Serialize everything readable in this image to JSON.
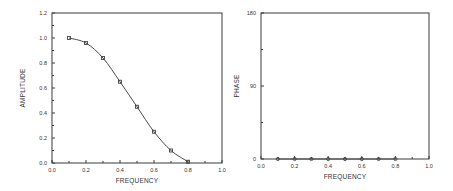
{
  "chart_data": [
    {
      "type": "line",
      "title": "",
      "xlabel": "FREQUENCY",
      "ylabel": "AMPLITUDE",
      "xlim": [
        0.0,
        1.0
      ],
      "ylim": [
        0.0,
        1.2
      ],
      "xticks": [
        "0.0",
        "0.2",
        "0.4",
        "0.6",
        "0.8",
        "1.0"
      ],
      "yticks": [
        "0.0",
        "0.2",
        "0.4",
        "0.6",
        "0.8",
        "1.0",
        "1.2"
      ],
      "grid": false,
      "legend": null,
      "series": [
        {
          "name": "amplitude",
          "marker": "square",
          "x": [
            0.1,
            0.2,
            0.3,
            0.4,
            0.5,
            0.6,
            0.7,
            0.8
          ],
          "values": [
            1.0,
            0.96,
            0.84,
            0.65,
            0.45,
            0.25,
            0.1,
            0.01
          ]
        }
      ]
    },
    {
      "type": "line",
      "title": "",
      "xlabel": "FREQUENCY",
      "ylabel": "PHASE",
      "xlim": [
        0.0,
        1.0
      ],
      "ylim": [
        0,
        180
      ],
      "xticks": [
        "0.0",
        "0.2",
        "0.4",
        "0.6",
        "0.8",
        "1.0"
      ],
      "yticks": [
        "0",
        "90",
        "180"
      ],
      "grid": false,
      "legend": null,
      "series": [
        {
          "name": "phase",
          "marker": "circle",
          "x": [
            0.1,
            0.2,
            0.3,
            0.4,
            0.5,
            0.6,
            0.7,
            0.8
          ],
          "values": [
            0,
            0,
            0,
            0,
            0,
            0,
            0,
            0
          ]
        }
      ]
    }
  ],
  "layout": {
    "plots": [
      {
        "left": 52,
        "right": 222,
        "top": 13,
        "bottom": 163,
        "minor_x": 10,
        "minor_y": 12
      },
      {
        "left": 261,
        "right": 429,
        "top": 13,
        "bottom": 159,
        "minor_x": 10,
        "minor_y": 4
      }
    ]
  }
}
